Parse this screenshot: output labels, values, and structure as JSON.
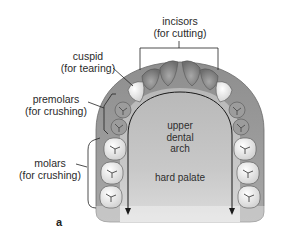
{
  "figure": {
    "panel_label": "a",
    "labels": {
      "incisors": {
        "name": "incisors",
        "function": "(for cutting)"
      },
      "cuspid": {
        "name": "cuspid",
        "function": "(for tearing)"
      },
      "premolars": {
        "name": "premolars",
        "function": "(for crushing)"
      },
      "molars": {
        "name": "molars",
        "function": "(for crushing)"
      }
    },
    "inner_labels": {
      "arch_line1": "upper",
      "arch_line2": "dental",
      "arch_line3": "arch",
      "palate": "hard palate"
    },
    "colors": {
      "gum": "#9a9a9a",
      "gum_dark": "#7a7a7a",
      "palate": "#c4c4c4",
      "tooth_light": "#f2f2f2",
      "tooth_shaded": "#8c8c8c",
      "line": "#222222"
    }
  }
}
